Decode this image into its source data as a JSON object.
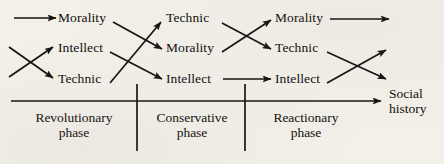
{
  "diagram": {
    "title_hidden": "",
    "columns": [
      {
        "id": "col1",
        "nodes": [
          {
            "id": "c1r1",
            "label": "Morality"
          },
          {
            "id": "c1r2",
            "label": "Intellect"
          },
          {
            "id": "c1r3",
            "label": "Technic"
          }
        ]
      },
      {
        "id": "col2",
        "nodes": [
          {
            "id": "c2r1",
            "label": "Technic"
          },
          {
            "id": "c2r2",
            "label": "Morality"
          },
          {
            "id": "c2r3",
            "label": "Intellect"
          }
        ]
      },
      {
        "id": "col3",
        "nodes": [
          {
            "id": "c3r1",
            "label": "Morality"
          },
          {
            "id": "c3r2",
            "label": "Technic"
          },
          {
            "id": "c3r3",
            "label": "Intellect"
          }
        ]
      }
    ],
    "phases": [
      {
        "id": "phase1",
        "line1": "Revolutionary",
        "line2": "phase"
      },
      {
        "id": "phase2",
        "line1": "Conservative",
        "line2": "phase"
      },
      {
        "id": "phase3",
        "line1": "Reactionary",
        "line2": "phase"
      }
    ],
    "axis": {
      "line1": "Social",
      "line2": "history"
    },
    "stroke_color": "#151210",
    "background_color": "#f3f0ea"
  }
}
